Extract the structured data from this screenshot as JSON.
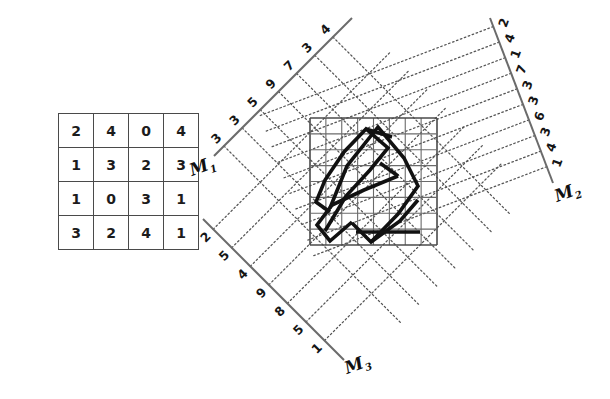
{
  "figure": {
    "title": "",
    "background_color": "#ffffff",
    "axis_color": "#6b6b6b",
    "grid_color": "#6a6a6a",
    "glyph_color": "#111111",
    "projection_color": "#555555"
  },
  "matrix": {
    "name": "projection-matrix",
    "rows": 4,
    "cols": 4,
    "values": [
      [
        2,
        4,
        0,
        4
      ],
      [
        1,
        3,
        2,
        3
      ],
      [
        1,
        0,
        3,
        1
      ],
      [
        3,
        2,
        4,
        1
      ]
    ]
  },
  "grid": {
    "name": "image-grid",
    "rows": 8,
    "cols": 8,
    "left": 310,
    "top": 118,
    "size": 127
  },
  "axes": [
    {
      "id": "M1",
      "label": "M",
      "subscript": "1",
      "label_x": 192,
      "label_y": 176,
      "x1": 214,
      "y1": 156,
      "x2": 352,
      "y2": 18,
      "tick_labels": [
        "3",
        "3",
        "5",
        "9",
        "7",
        "3",
        "4"
      ],
      "tick_rotation": -45,
      "projection_count": 7
    },
    {
      "id": "M2",
      "label": "M",
      "subscript": "2",
      "label_x": 557,
      "label_y": 202,
      "x1": 490,
      "y1": 18,
      "x2": 553,
      "y2": 183,
      "tick_labels": [
        "2",
        "4",
        "1",
        "7",
        "3",
        "3",
        "6",
        "3",
        "4",
        "1"
      ],
      "tick_rotation": -70,
      "projection_count": 10
    },
    {
      "id": "M3",
      "label": "M",
      "subscript": "3",
      "label_x": 347,
      "label_y": 374,
      "x1": 203,
      "y1": 219,
      "x2": 344,
      "y2": 360,
      "tick_labels": [
        "2",
        "5",
        "4",
        "9",
        "8",
        "5",
        "1"
      ],
      "tick_rotation": -45,
      "projection_count": 7
    }
  ],
  "glyph": {
    "name": "sinogram-glyph",
    "description": "thick rotated zig-zag figure drawn on the image grid",
    "stroke_width": 3.6,
    "paths": [
      "M 330 208 L 347 166 L 378 127 L 404 158 L 418 186 L 398 214 L 371 242 L 352 223",
      "M 325 231 L 346 196 L 370 170 L 388 148 L 366 129 L 344 152 L 325 180 L 316 202 L 330 212",
      "M 352 222 L 330 241 L 317 225 L 332 205",
      "M 371 242 L 400 221 L 418 200",
      "M 366 129 L 392 137",
      "M 332 205 L 364 190 L 398 176",
      "M 398 176 L 380 163",
      "M 356 232 L 420 232"
    ]
  }
}
